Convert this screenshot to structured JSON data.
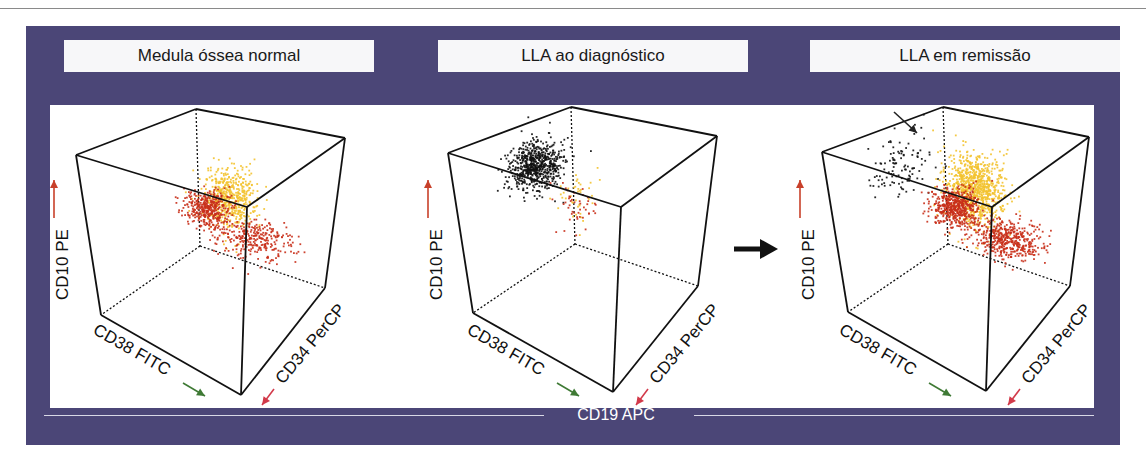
{
  "figure": {
    "bottom_axis_label": "CD19 APC",
    "colors": {
      "frame": "#4b4677",
      "cluster_yellow": "#f3c330",
      "cluster_red": "#c9301b",
      "cluster_black": "#111111",
      "arrow_green": "#3f7a35",
      "arrow_red": "#d23a4a",
      "arrow_up": "#c8402a"
    },
    "axis_labels": {
      "vertical": "CD10 PE",
      "left": "CD38 FITC",
      "right": "CD34 PerCP"
    },
    "panels": [
      {
        "title": "Medula óssea normal",
        "clusters": [
          {
            "name": "yellow-population",
            "color": "cluster_yellow",
            "n": 520,
            "u": 0.45,
            "v": 0.25,
            "w": 0.62,
            "su": 0.09,
            "sv": 0.08,
            "sw": 0.1
          },
          {
            "name": "red-population-main",
            "color": "cluster_red",
            "n": 380,
            "u": 0.15,
            "v": 0.1,
            "w": 0.38,
            "su": 0.08,
            "sv": 0.07,
            "sw": 0.05
          },
          {
            "name": "red-population-spread",
            "color": "cluster_red",
            "n": 300,
            "u": 0.55,
            "v": 0.15,
            "w": 0.3,
            "su": 0.14,
            "sv": 0.08,
            "sw": 0.05
          }
        ]
      },
      {
        "title": "LLA ao diagnóstico",
        "clusters": [
          {
            "name": "black-population",
            "color": "cluster_black",
            "n": 650,
            "u": 0.05,
            "v": 0.42,
            "w": 0.8,
            "su": 0.08,
            "sv": 0.1,
            "sw": 0.07
          },
          {
            "name": "yellow-population",
            "color": "cluster_yellow",
            "n": 40,
            "u": 0.3,
            "v": 0.3,
            "w": 0.6,
            "su": 0.06,
            "sv": 0.06,
            "sw": 0.08
          },
          {
            "name": "red-population",
            "color": "cluster_red",
            "n": 45,
            "u": 0.15,
            "v": 0.15,
            "w": 0.4,
            "su": 0.07,
            "sv": 0.06,
            "sw": 0.07
          }
        ]
      },
      {
        "title": "LLA em remissão",
        "clusters": [
          {
            "name": "black-residual-population",
            "color": "cluster_black",
            "n": 110,
            "u": 0.0,
            "v": 0.45,
            "w": 0.8,
            "su": 0.08,
            "sv": 0.12,
            "sw": 0.1
          },
          {
            "name": "yellow-population",
            "color": "cluster_yellow",
            "n": 900,
            "u": 0.45,
            "v": 0.25,
            "w": 0.66,
            "su": 0.1,
            "sv": 0.07,
            "sw": 0.12
          },
          {
            "name": "red-population-main",
            "color": "cluster_red",
            "n": 520,
            "u": 0.15,
            "v": 0.1,
            "w": 0.38,
            "su": 0.08,
            "sv": 0.07,
            "sw": 0.05
          },
          {
            "name": "red-population-spread",
            "color": "cluster_red",
            "n": 480,
            "u": 0.6,
            "v": 0.15,
            "w": 0.3,
            "su": 0.13,
            "sv": 0.08,
            "sw": 0.05
          }
        ]
      }
    ]
  }
}
